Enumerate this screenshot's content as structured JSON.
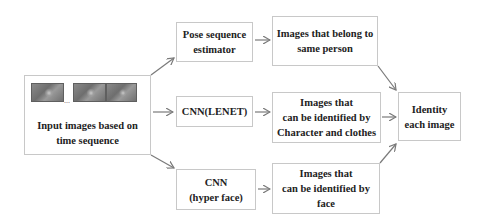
{
  "diagram": {
    "nodes": {
      "input": {
        "lines": [
          "Input images based on",
          "time sequence"
        ],
        "thumbnail_count": 3,
        "ellipsis": "..."
      },
      "pose": {
        "lines": [
          "Pose sequence",
          "estimator"
        ]
      },
      "lenet": {
        "lines": [
          "CNN(LENET)"
        ]
      },
      "hyperface": {
        "lines": [
          "CNN",
          "(hyper face)"
        ]
      },
      "same_person": {
        "lines": [
          "Images that belong to",
          "same person"
        ]
      },
      "char_clothes": {
        "lines": [
          "Images that",
          "can be identified by",
          "Character and clothes"
        ]
      },
      "by_face": {
        "lines": [
          "Images that",
          "can be identified by",
          "face"
        ]
      },
      "identity": {
        "lines": [
          "Identity",
          "each image"
        ]
      }
    },
    "edges": [
      {
        "from": "input",
        "to": "pose"
      },
      {
        "from": "input",
        "to": "lenet"
      },
      {
        "from": "input",
        "to": "hyperface"
      },
      {
        "from": "pose",
        "to": "same_person"
      },
      {
        "from": "lenet",
        "to": "char_clothes"
      },
      {
        "from": "hyperface",
        "to": "by_face"
      },
      {
        "from": "same_person",
        "to": "identity"
      },
      {
        "from": "char_clothes",
        "to": "identity"
      },
      {
        "from": "by_face",
        "to": "identity"
      }
    ],
    "colors": {
      "border": "#c8c8c8",
      "arrow": "#7a7a7a",
      "text": "#222222"
    }
  }
}
